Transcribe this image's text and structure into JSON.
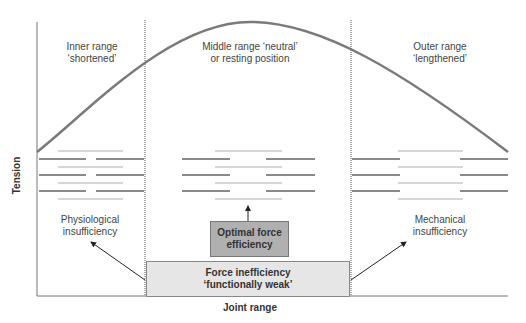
{
  "diagram": {
    "axis": {
      "y_label": "Tension",
      "x_label": "Joint range"
    },
    "regions": [
      {
        "id": "inner",
        "line1": "Inner range",
        "line2": "‘shortened’",
        "note1": "Physiological",
        "note2": "insufficiency"
      },
      {
        "id": "middle",
        "line1": "Middle range ‘neutral’",
        "line2": "or resting position"
      },
      {
        "id": "outer",
        "line1": "Outer range",
        "line2": "‘lengthened’",
        "note1": "Mechanical",
        "note2": "insufficiency"
      }
    ],
    "optimal_box": {
      "line1": "Optimal force",
      "line2": "efficiency"
    },
    "inefficiency_box": {
      "line1": "Force inefficiency",
      "line2": "‘functionally weak’"
    },
    "colors": {
      "curve": "#7a7a7a",
      "myosin": "#8a8a8a",
      "actin": "#c8c8c8",
      "optimal_fill": "#b0b0b0",
      "inefficiency_fill": "#e6e6e6"
    }
  }
}
